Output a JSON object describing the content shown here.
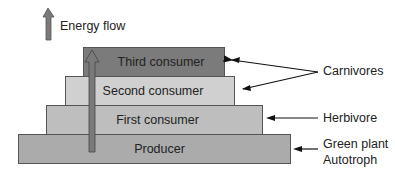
{
  "legend": {
    "icon": "up-arrow-icon",
    "label": "Energy flow"
  },
  "pyramid": {
    "levels": [
      {
        "label": "Third consumer",
        "color": "#7b7b7b"
      },
      {
        "label": "Second consumer",
        "color": "#d0d0d0"
      },
      {
        "label": "First consumer",
        "color": "#bebebe"
      },
      {
        "label": "Producer",
        "color": "#ababab"
      }
    ],
    "energy_arrow_color": "#6f6f6f"
  },
  "annotations": {
    "carnivores": "Carnivores",
    "herbivore": "Herbivore",
    "green_plant": "Green plant",
    "autotroph": "Autotroph"
  }
}
